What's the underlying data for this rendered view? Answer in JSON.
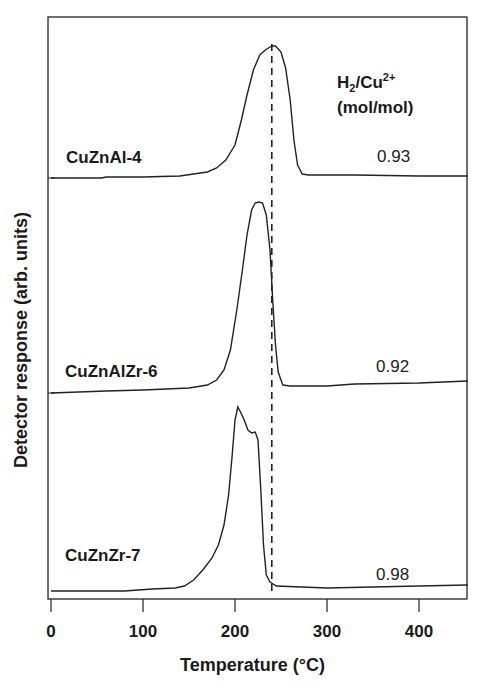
{
  "chart_data": {
    "type": "line",
    "title": "",
    "xlabel": "Temperature (°C)",
    "ylabel": "Detector response (arb. units)",
    "xlim": [
      -3,
      453
    ],
    "xticks": [
      0,
      100,
      200,
      300,
      400
    ],
    "grid": false,
    "legend": "none; series labeled inline",
    "annotation": {
      "header_line1": "H2/Cu2+",
      "header_line2": "(mol/mol)",
      "reference_line": {
        "style": "dashed",
        "x": 240
      }
    },
    "series": [
      {
        "name": "CuZnAl-4",
        "h2_cu_ratio": "0.93",
        "peak_temperature": 240,
        "baseline_y_px": [
          178,
          176
        ],
        "points": [
          [
            0,
            178
          ],
          [
            55,
            178
          ],
          [
            60,
            177
          ],
          [
            100,
            177
          ],
          [
            140,
            176
          ],
          [
            170,
            172
          ],
          [
            180,
            168
          ],
          [
            190,
            160
          ],
          [
            200,
            145
          ],
          [
            207,
            120
          ],
          [
            213,
            95
          ],
          [
            220,
            70
          ],
          [
            227,
            55
          ],
          [
            233,
            50
          ],
          [
            238,
            47
          ],
          [
            240,
            46
          ],
          [
            244,
            46
          ],
          [
            250,
            52
          ],
          [
            255,
            68
          ],
          [
            260,
            100
          ],
          [
            264,
            140
          ],
          [
            268,
            165
          ],
          [
            273,
            174
          ],
          [
            280,
            175
          ],
          [
            330,
            175
          ],
          [
            400,
            176
          ],
          [
            453,
            176
          ]
        ]
      },
      {
        "name": "CuZnAlZr-6",
        "h2_cu_ratio": "0.92",
        "peak_temperature": 228,
        "baseline_y_px": [
          393,
          381
        ],
        "points": [
          [
            0,
            393
          ],
          [
            60,
            391
          ],
          [
            100,
            390
          ],
          [
            150,
            388
          ],
          [
            170,
            385
          ],
          [
            180,
            380
          ],
          [
            188,
            370
          ],
          [
            195,
            350
          ],
          [
            202,
            310
          ],
          [
            208,
            270
          ],
          [
            213,
            235
          ],
          [
            218,
            210
          ],
          [
            222,
            203
          ],
          [
            226,
            202
          ],
          [
            230,
            203
          ],
          [
            234,
            215
          ],
          [
            238,
            250
          ],
          [
            241,
            300
          ],
          [
            244,
            345
          ],
          [
            247,
            372
          ],
          [
            252,
            385
          ],
          [
            260,
            386
          ],
          [
            300,
            386
          ],
          [
            330,
            384
          ],
          [
            400,
            383
          ],
          [
            453,
            381
          ]
        ]
      },
      {
        "name": "CuZnZr-7",
        "h2_cu_ratio": "0.98",
        "peak_temperature": 204,
        "shoulder_temperature": 222,
        "baseline_y_px": [
          591,
          587
        ],
        "points": [
          [
            0,
            591
          ],
          [
            80,
            591
          ],
          [
            110,
            589
          ],
          [
            135,
            588
          ],
          [
            145,
            586
          ],
          [
            155,
            580
          ],
          [
            165,
            570
          ],
          [
            175,
            558
          ],
          [
            182,
            545
          ],
          [
            188,
            525
          ],
          [
            193,
            495
          ],
          [
            197,
            455
          ],
          [
            200,
            420
          ],
          [
            203,
            407
          ],
          [
            206,
            412
          ],
          [
            210,
            420
          ],
          [
            214,
            430
          ],
          [
            218,
            433
          ],
          [
            222,
            432
          ],
          [
            225,
            440
          ],
          [
            228,
            490
          ],
          [
            231,
            545
          ],
          [
            234,
            575
          ],
          [
            238,
            582
          ],
          [
            245,
            586
          ],
          [
            300,
            588
          ],
          [
            350,
            587
          ],
          [
            400,
            586
          ],
          [
            453,
            585
          ]
        ]
      }
    ]
  },
  "axes": {
    "x_title": "Temperature (°C)",
    "y_title": "Detector response (arb. units)",
    "x_tick_labels": [
      "0",
      "100",
      "200",
      "300",
      "400"
    ]
  },
  "labels": {
    "s1": "CuZnAl-4",
    "s2": "CuZnAlZr-6",
    "s3": "CuZnZr-7",
    "v1": "0.93",
    "v2": "0.92",
    "v3": "0.98",
    "ann_h": "H",
    "ann_sub": "2",
    "ann_mid": "/Cu",
    "ann_sup": "2+",
    "ann_units": "(mol/mol)"
  }
}
